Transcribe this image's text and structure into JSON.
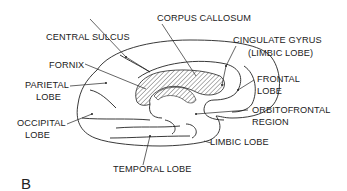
{
  "figure": {
    "panel_label": "B",
    "labels": {
      "corpus_callosum": "CORPUS CALLOSUM",
      "central_sulcus": "CENTRAL SULCUS",
      "cingulate_gyrus_1": "CINGULATE GYRUS",
      "cingulate_gyrus_2": "(LIMBIC LOBE)",
      "fornix": "FORNIX",
      "frontal_1": "FRONTAL",
      "frontal_2": "LOBE",
      "parietal_1": "PARIETAL",
      "parietal_2": "LOBE",
      "orbitofrontal_1": "ORBITOFRONTAL",
      "orbitofrontal_2": "REGION",
      "occipital_1": "OCCIPITAL",
      "occipital_2": "LOBE",
      "limbic": "LIMBIC LOBE",
      "temporal": "TEMPORAL LOBE"
    },
    "colors": {
      "ink": "#222222",
      "background": "#ffffff"
    }
  }
}
